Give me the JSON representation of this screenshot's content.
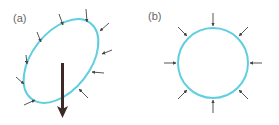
{
  "figure": {
    "colors": {
      "outline": "#5fcfe0",
      "small_arrow": "#444444",
      "big_arrow": "#3a2a28",
      "label": "#666666"
    },
    "panels": [
      {
        "id": "a",
        "label": "(a)",
        "shape": "tilted-ellipse",
        "inward_arrows": 10,
        "has_large_downward_arrow": true
      },
      {
        "id": "b",
        "label": "(b)",
        "shape": "circle",
        "inward_arrows": 8,
        "has_large_downward_arrow": false
      }
    ]
  }
}
